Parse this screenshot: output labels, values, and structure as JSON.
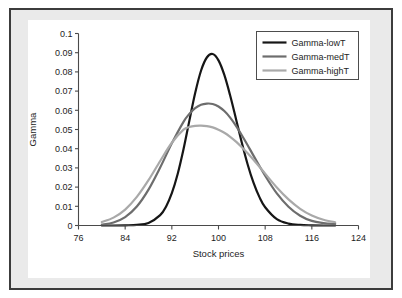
{
  "chart_data": {
    "type": "line",
    "title": "",
    "xlabel": "Stock prices",
    "ylabel": "Gamma",
    "xlim": [
      76,
      124
    ],
    "ylim": [
      0,
      0.1
    ],
    "xticks": [
      76,
      84,
      92,
      100,
      108,
      116,
      124
    ],
    "xticklabels": [
      "76",
      "84",
      "92",
      "100",
      "108",
      "116",
      "124"
    ],
    "yticks": [
      0,
      0.01,
      0.02,
      0.03,
      0.04,
      0.05,
      0.06,
      0.07,
      0.08,
      0.09,
      0.1
    ],
    "yticklabels": [
      "0",
      "0.01",
      "0.02",
      "0.03",
      "0.04",
      "0.05",
      "0.06",
      "0.07",
      "0.08",
      "0.09",
      "0.1"
    ],
    "grid": false,
    "legend_position": "upper right",
    "series": [
      {
        "name": "Gamma-lowT",
        "color": "#161616",
        "linewidth": 2.2,
        "peak_x": 100,
        "peak_y": 0.0895,
        "x": [
          80,
          82,
          84,
          86,
          88,
          90,
          91,
          92,
          93,
          94,
          95,
          96,
          97,
          98,
          99,
          100,
          101,
          102,
          103,
          104,
          105,
          106,
          107,
          108,
          110,
          112,
          114,
          116,
          118,
          120
        ],
        "y": [
          0.0,
          0.0,
          0.0001,
          0.0003,
          0.0013,
          0.0054,
          0.0098,
          0.0168,
          0.0268,
          0.0397,
          0.0545,
          0.069,
          0.0806,
          0.0875,
          0.0893,
          0.086,
          0.0784,
          0.0677,
          0.0555,
          0.0431,
          0.0318,
          0.0223,
          0.0149,
          0.0095,
          0.0033,
          0.001,
          0.0003,
          0.0001,
          0.0,
          0.0
        ]
      },
      {
        "name": "Gamma-medT",
        "color": "#6d6d6d",
        "linewidth": 2.2,
        "peak_x": 99.5,
        "peak_y": 0.0635,
        "x": [
          80,
          82,
          84,
          86,
          88,
          90,
          92,
          94,
          95,
          96,
          97,
          98,
          99,
          100,
          101,
          102,
          103,
          104,
          105,
          106,
          108,
          110,
          112,
          114,
          116,
          118,
          120
        ],
        "y": [
          0.0005,
          0.0016,
          0.0044,
          0.0099,
          0.0187,
          0.0302,
          0.0428,
          0.054,
          0.0581,
          0.0611,
          0.0629,
          0.0635,
          0.0633,
          0.062,
          0.0596,
          0.0562,
          0.0519,
          0.047,
          0.0418,
          0.0364,
          0.0259,
          0.0167,
          0.0098,
          0.0051,
          0.0024,
          0.0013,
          0.0008
        ]
      },
      {
        "name": "Gamma-highT",
        "color": "#a9a9a9",
        "linewidth": 2.2,
        "peak_x": 98.5,
        "peak_y": 0.052,
        "x": [
          80,
          82,
          84,
          86,
          88,
          90,
          92,
          94,
          95,
          96,
          97,
          98,
          99,
          100,
          101,
          102,
          103,
          104,
          105,
          106,
          108,
          110,
          112,
          114,
          116,
          118,
          120
        ],
        "y": [
          0.0018,
          0.0041,
          0.0083,
          0.0149,
          0.0236,
          0.0336,
          0.0431,
          0.0499,
          0.0513,
          0.0519,
          0.052,
          0.0518,
          0.0511,
          0.0499,
          0.0483,
          0.0462,
          0.0437,
          0.0408,
          0.0376,
          0.0342,
          0.027,
          0.0198,
          0.0136,
          0.0087,
          0.0052,
          0.003,
          0.0017
        ]
      }
    ]
  },
  "legend": {
    "entries": [
      {
        "label": "Gamma-lowT"
      },
      {
        "label": "Gamma-medT"
      },
      {
        "label": "Gamma-highT"
      }
    ]
  },
  "axes": {
    "x_title": "Stock prices",
    "y_title": "Gamma"
  }
}
